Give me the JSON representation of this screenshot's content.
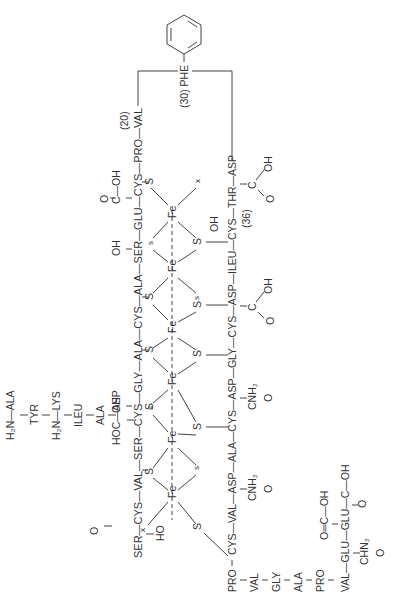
{
  "diagram": {
    "type": "protein-structure",
    "orientation": "rotated 90° counter-clockwise",
    "residue_numbers": [
      "(20)",
      "(30)",
      "(36)"
    ],
    "labels": {
      "n_term1": "H₂N—ALA",
      "tyr": "TYR",
      "n_term2": "H₂N—LYS",
      "ileu1": "ILEU",
      "ala1": "ALA",
      "hoc_asp": "HOC—ASP",
      "hoc_o": "O",
      "main_chain_top": "SER—CYS—VAL—SER—CYS—GLY—ALA—CYS—ALA—SER—GLU—CYS—PRO—VAL",
      "ser_oh": "HO",
      "ser2_oh": "OH",
      "ser3_oh": "OH",
      "glu_cooh": "C—OH",
      "glu_o": "O",
      "num20": "(20)",
      "phe": "(30) PHE",
      "chain_mid": "CYS—VAL—ASP—ALA—CYS—ASP—GLY—CYS—ASP—ILEU—CYS—THR—ASP",
      "pro": "PRO",
      "num36": "(36)",
      "thr_oh": "OH",
      "asp_c": "C",
      "asp_oh": "OH",
      "asp_o": "O",
      "asp2_c": "C",
      "asp2_oh": "OH",
      "asp2_o": "O",
      "cnh2_1": "CNH₂",
      "cnh2_1o": "O",
      "cnh2_2": "CNH₂",
      "cnh2_2o": "O",
      "bottom_chain": [
        "VAL",
        "GLY",
        "ALA",
        "PRO"
      ],
      "last_chain": "VAL—GLU—GLU—C—OH",
      "last_o": "O",
      "glu_side_c": "O═C—OH",
      "chn2": "CHN₂",
      "chn2_o": "O",
      "fe": "Fe",
      "s_big": "S",
      "s_small": "s",
      "x": "x"
    }
  }
}
